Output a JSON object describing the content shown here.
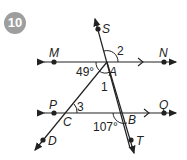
{
  "problem": {
    "number": "10"
  },
  "diagram": {
    "points": {
      "M": "M",
      "N": "N",
      "P": "P",
      "Q": "Q",
      "S": "S",
      "A": "A",
      "B": "B",
      "C": "C",
      "D": "D",
      "T": "T"
    },
    "angles": {
      "angle_49": "49°",
      "angle_107": "107°",
      "angle_1": "1",
      "angle_2": "2",
      "angle_3": "3"
    },
    "lines": [
      {
        "name": "MN",
        "parallel_mark": true
      },
      {
        "name": "PQ",
        "parallel_mark": true
      },
      {
        "name": "ST",
        "through": [
          "S",
          "A",
          "B",
          "T"
        ]
      },
      {
        "name": "AD",
        "through": [
          "A",
          "C",
          "D"
        ]
      }
    ],
    "colors": {
      "line": "#222222",
      "badge": "#9e9e9e"
    }
  }
}
